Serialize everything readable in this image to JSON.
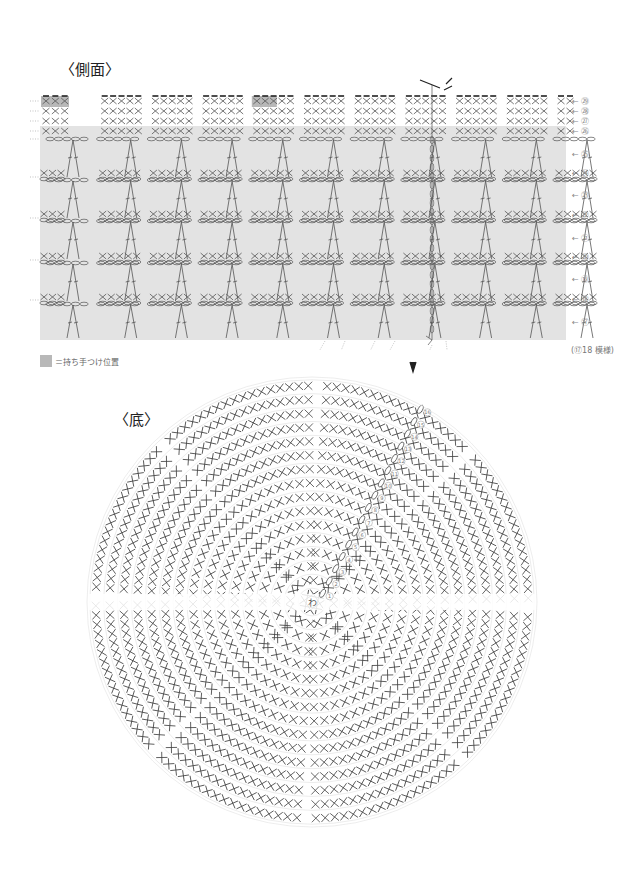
{
  "side": {
    "title": "〈側面〉",
    "row_labels": [
      {
        "num": "29",
        "label": "← ㉙",
        "y": 101
      },
      {
        "num": "28",
        "label": "← ㉘",
        "y": 111
      },
      {
        "num": "27",
        "label": "← ㉗",
        "y": 121
      },
      {
        "num": "26",
        "label": "← ㉖",
        "y": 131
      },
      {
        "num": "25",
        "label": "← ㉕",
        "y": 154
      },
      {
        "num": "24",
        "label": "← ㉔",
        "y": 173
      },
      {
        "num": "23",
        "label": "← ㉓",
        "y": 195
      },
      {
        "num": "22",
        "label": "← ㉒",
        "y": 215
      },
      {
        "num": "21",
        "label": "← ㉑",
        "y": 238
      },
      {
        "num": "20",
        "label": "← ⑳",
        "y": 257
      },
      {
        "num": "19",
        "label": "← ⑲",
        "y": 279
      },
      {
        "num": "18",
        "label": "← ⑱",
        "y": 299
      },
      {
        "num": "17",
        "label": "← ⑰",
        "y": 322
      }
    ],
    "repeat_note": "(⑰18 模様)",
    "fill_color": "#e3e3e3",
    "handle_color": "#b8b8b8",
    "stitch_color": "#555555"
  },
  "legend": {
    "text": "＝持ち手つけ位置"
  },
  "bottom": {
    "title": "〈底〉",
    "center_label": "わ",
    "round_numbers": [
      "①",
      "②",
      "③",
      "④",
      "⑤",
      "⑥",
      "⑦",
      "⑧",
      "⑨",
      "⑩",
      "⑪",
      "⑫",
      "⑬",
      "⑭",
      "⑮",
      "⑯"
    ],
    "rounds": 16,
    "sectors": 8
  }
}
